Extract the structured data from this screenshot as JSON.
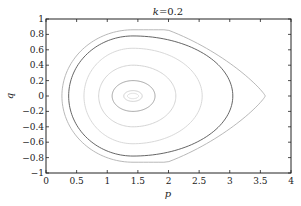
{
  "chart_data": {
    "type": "line",
    "title": "k=0.2",
    "title_parts": {
      "var": "k",
      "eq": "=0.2"
    },
    "xlabel": "p",
    "ylabel": "q",
    "xlim": [
      0,
      4
    ],
    "ylim": [
      -1,
      1
    ],
    "xticks": [
      0,
      0.5,
      1,
      1.5,
      2,
      2.5,
      3,
      3.5,
      4
    ],
    "xtick_labels": [
      "0",
      "0.5",
      "1",
      "1.5",
      "2",
      "2.5",
      "3",
      "3.5",
      "4"
    ],
    "yticks": [
      -1,
      -0.8,
      -0.6,
      -0.4,
      -0.2,
      0,
      0.2,
      0.4,
      0.6,
      0.8,
      1
    ],
    "ytick_labels": [
      "−1",
      "−0.8",
      "−0.6",
      "−0.4",
      "−0.2",
      "0",
      "0.2",
      "0.4",
      "0.6",
      "0.8",
      "1"
    ],
    "grid": false,
    "legend": null,
    "center": [
      1.42,
      0
    ],
    "series": [
      {
        "name": "separatrix",
        "p_min": 0.26,
        "p_max": 3.58,
        "q_max": 0.86,
        "color": "#b0b0b0",
        "cusp": true
      },
      {
        "name": "orbit-1",
        "p_min": 0.37,
        "p_max": 3.05,
        "q_max": 0.78,
        "color": "#555555"
      },
      {
        "name": "orbit-2",
        "p_min": 0.62,
        "p_max": 2.55,
        "q_max": 0.62,
        "color": "#d4d4d4"
      },
      {
        "name": "orbit-3",
        "p_min": 0.86,
        "p_max": 2.12,
        "q_max": 0.4,
        "color": "#cfcfcf"
      },
      {
        "name": "orbit-4",
        "p_min": 1.08,
        "p_max": 1.78,
        "q_max": 0.2,
        "color": "#9a9a9a"
      },
      {
        "name": "orbit-5",
        "p_min": 1.27,
        "p_max": 1.57,
        "q_max": 0.07,
        "color": "#c8c8c8"
      },
      {
        "name": "orbit-6",
        "p_min": 1.33,
        "p_max": 1.51,
        "q_max": 0.035,
        "color": "#d8d8d8"
      }
    ]
  }
}
